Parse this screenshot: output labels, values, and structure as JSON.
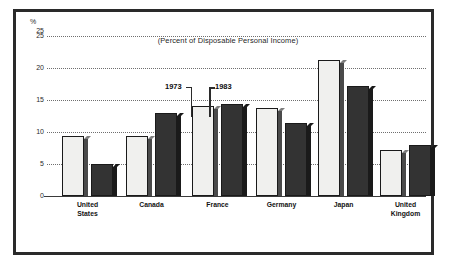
{
  "figure": {
    "title": "(Percent of Disposable Personal Income)",
    "percent_symbol": "%"
  },
  "legend": {
    "entries": [
      {
        "label": "1973",
        "swatch": "light",
        "color": "#f0f0ee"
      },
      {
        "label": "1983",
        "swatch": "dark",
        "color": "#333333"
      }
    ]
  },
  "axis": {
    "y_ticks": [
      "25",
      "20",
      "15",
      "10",
      "5",
      "0"
    ]
  },
  "colors": {
    "frame": "#2a2a2a",
    "grid": "#6f6f6f",
    "bar_1973": "#f0f0ee",
    "bar_1983": "#333333",
    "text": "#121212",
    "background": "#ffffff"
  },
  "chart_data": {
    "type": "bar",
    "title": "(Percent of Disposable Personal Income)",
    "xlabel": "",
    "ylabel": "%",
    "ylim": [
      0,
      25
    ],
    "yticks": [
      0,
      5,
      10,
      15,
      20,
      25
    ],
    "grid": true,
    "legend_position": "inside-top-center",
    "categories": [
      "United States",
      "Canada",
      "France",
      "Germany",
      "Japan",
      "United Kingdom"
    ],
    "category_lines": [
      [
        "United",
        "States"
      ],
      [
        "Canada"
      ],
      [
        "France"
      ],
      [
        "Germany"
      ],
      [
        "Japan"
      ],
      [
        "United",
        "Kingdom"
      ]
    ],
    "series": [
      {
        "name": "1973",
        "values": [
          9.3,
          9.3,
          14.0,
          13.8,
          21.2,
          7.2
        ]
      },
      {
        "name": "1983",
        "values": [
          5.0,
          12.9,
          14.4,
          11.4,
          17.2,
          8.0
        ]
      }
    ],
    "annotations": [
      {
        "text": "1973",
        "points_to": "France 1973 bar"
      },
      {
        "text": "1983",
        "points_to": "France 1983 bar"
      }
    ]
  }
}
